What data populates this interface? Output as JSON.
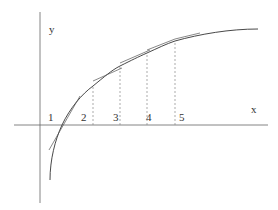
{
  "diagram": {
    "type": "function-graph-with-tangent-lines",
    "axes": {
      "x_label": "x",
      "y_label": "y"
    },
    "tick_labels": [
      "1",
      "2",
      "3",
      "4",
      "5"
    ],
    "curve": "logarithmic-like increasing concave curve crossing x-axis near label 1",
    "tangent_lines_count": 5,
    "dashed_verticals_at_labels": [
      "2",
      "3",
      "4",
      "5"
    ],
    "colors": {
      "axis": "#555555",
      "curve": "#333333",
      "tangent": "#666666",
      "dashed": "#888888"
    }
  }
}
